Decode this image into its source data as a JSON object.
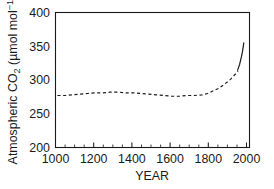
{
  "chart_data": {
    "type": "line",
    "title": "",
    "xlabel": "YEAR",
    "ylabel": "Atmospheric CO2 (umol mol-1)",
    "ylabel_parts": {
      "lead": "Atmospheric CO",
      "subscript": "2",
      "unit_open": " (µmol mol",
      "superscript": "−1",
      "unit_close": ")"
    },
    "xlim": [
      1000,
      2020
    ],
    "ylim": [
      200,
      400
    ],
    "xticks": [
      1000,
      1200,
      1400,
      1600,
      1800,
      2000
    ],
    "yticks": [
      200,
      250,
      300,
      350,
      400
    ],
    "xtick_labels": [
      "1000",
      "1200",
      "1400",
      "1600",
      "1800",
      "2000"
    ],
    "ytick_labels": [
      "200",
      "250",
      "300",
      "350",
      "400"
    ],
    "x_minor_interval": 50,
    "y_minor_interval": 10,
    "grid": false,
    "legend": false,
    "frame": "box",
    "tick_direction": "in",
    "series": [
      {
        "name": "Ice core record",
        "style": "dashed",
        "x": [
          1010,
          1050,
          1090,
          1130,
          1170,
          1210,
          1250,
          1290,
          1330,
          1370,
          1410,
          1450,
          1490,
          1530,
          1570,
          1610,
          1650,
          1690,
          1730,
          1770,
          1800,
          1830,
          1860,
          1890,
          1920,
          1950,
          1960
        ],
        "values": [
          277,
          277,
          278,
          279,
          280,
          281,
          281,
          282,
          282,
          281,
          281,
          280,
          279,
          278,
          277,
          276,
          276,
          277,
          277,
          278,
          280,
          284,
          288,
          294,
          301,
          310,
          314
        ]
      },
      {
        "name": "Mauna Loa record",
        "style": "solid",
        "x": [
          1958,
          1963,
          1968,
          1973,
          1978,
          1983,
          1988,
          1990
        ],
        "values": [
          315,
          319,
          323,
          329,
          335,
          342,
          351,
          355
        ]
      }
    ]
  }
}
